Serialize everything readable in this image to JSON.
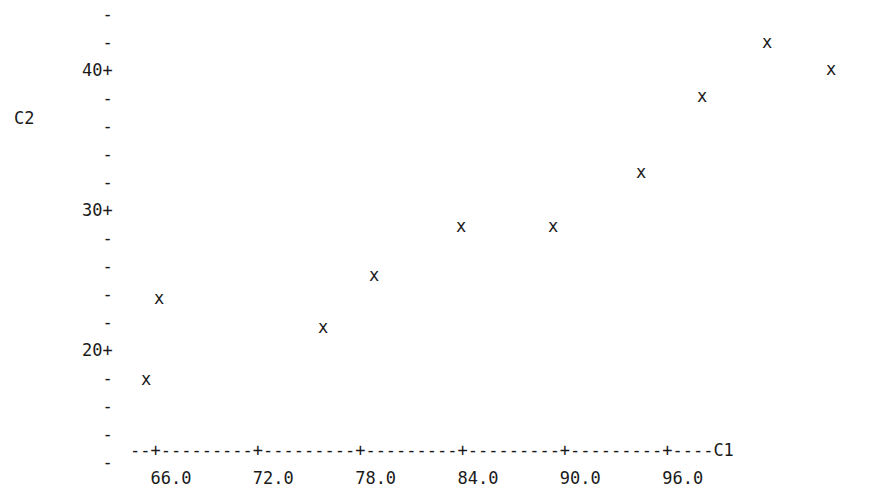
{
  "plot": {
    "type": "character-scatterplot",
    "y_variable_label": "C2",
    "x_variable_label": "C1",
    "point_glyph": "x",
    "tick_glyph": "+",
    "minor_tick_glyph": "-",
    "axis_dash_glyph": "-",
    "text_color": "#1a1a1a",
    "background_color": "#ffffff"
  },
  "y_axis": {
    "rows": [
      {
        "label": "",
        "tick": "-"
      },
      {
        "label": "",
        "tick": "-"
      },
      {
        "label": "40",
        "tick": "+"
      },
      {
        "label": "",
        "tick": "-"
      },
      {
        "label": "",
        "tick": "-"
      },
      {
        "label": "",
        "tick": "-"
      },
      {
        "label": "",
        "tick": "-"
      },
      {
        "label": "30",
        "tick": "+"
      },
      {
        "label": "",
        "tick": "-"
      },
      {
        "label": "",
        "tick": "-"
      },
      {
        "label": "",
        "tick": "-"
      },
      {
        "label": "",
        "tick": "-"
      },
      {
        "label": "20",
        "tick": "+"
      },
      {
        "label": "",
        "tick": "-"
      },
      {
        "label": "",
        "tick": "-"
      },
      {
        "label": "",
        "tick": "-"
      },
      {
        "label": "",
        "tick": "-"
      }
    ],
    "labeled_ticks": [
      "40+",
      "30+",
      "20+"
    ]
  },
  "x_axis": {
    "rule": "--+---------+---------+---------+---------+---------+----C1",
    "tick_labels": [
      "66.0",
      "72.0",
      "78.0",
      "84.0",
      "90.0",
      "96.0"
    ],
    "tick_label_row": "  66.0      72.0      78.0      84.0      90.0      96.0"
  },
  "chart_data": {
    "type": "scatter",
    "title": "",
    "xlabel": "C1",
    "ylabel": "C2",
    "xlim": [
      64.0,
      99.0
    ],
    "ylim": [
      16.0,
      43.5
    ],
    "grid": false,
    "legend": null,
    "marker": "x",
    "series": [
      {
        "name": "C2 vs C1",
        "x": [
          64.5,
          65.5,
          74.0,
          76.5,
          81.0,
          85.0,
          89.0,
          92.5,
          96.0,
          98.0
        ],
        "y": [
          18.5,
          21.5,
          20.0,
          23.5,
          27.0,
          27.0,
          31.0,
          38.5,
          42.0,
          40.0
        ]
      }
    ],
    "xticks": [
      66.0,
      72.0,
      78.0,
      84.0,
      90.0,
      96.0
    ],
    "yticks": [
      20,
      30,
      40
    ],
    "n_points": 10
  },
  "points_pixels": [
    {
      "id": "p1",
      "left": 159,
      "top": 298
    },
    {
      "id": "p2",
      "left": 146,
      "top": 379
    },
    {
      "id": "p3",
      "left": 323,
      "top": 327
    },
    {
      "id": "p4",
      "left": 374,
      "top": 275
    },
    {
      "id": "p5",
      "left": 461,
      "top": 226
    },
    {
      "id": "p6",
      "left": 553,
      "top": 226
    },
    {
      "id": "p7",
      "left": 641,
      "top": 172
    },
    {
      "id": "p8",
      "left": 702,
      "top": 96
    },
    {
      "id": "p9",
      "left": 767,
      "top": 42
    },
    {
      "id": "p10",
      "left": 831,
      "top": 69
    }
  ]
}
